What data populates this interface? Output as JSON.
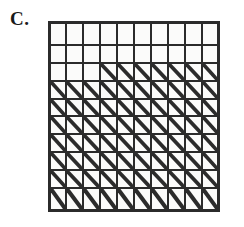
{
  "figure": {
    "label": "C.",
    "type": "grid-diagram",
    "colors": {
      "line": "#2b2b2b",
      "cell_fill": "#fbfbfa",
      "background": "#ffffff",
      "label": "#1a1a1a"
    }
  },
  "grid": {
    "rows": 10,
    "columns": 10,
    "total_cells": 100,
    "hatched_cells": 77,
    "empty_cells": 23,
    "diagonal_direction": "top-left-to-bottom-right",
    "row_labels": [
      "1",
      "2",
      "3",
      "4",
      "5",
      "6",
      "7",
      "8",
      "9",
      "10"
    ],
    "column_labels": [
      "1",
      "2",
      "3",
      "4",
      "5",
      "6",
      "7",
      "8",
      "9",
      "10"
    ],
    "cells": [
      [
        0,
        0,
        0,
        0,
        0,
        0,
        0,
        0,
        0,
        0
      ],
      [
        0,
        0,
        0,
        0,
        0,
        0,
        0,
        0,
        0,
        0
      ],
      [
        0,
        0,
        0,
        1,
        1,
        1,
        1,
        1,
        1,
        1
      ],
      [
        1,
        1,
        1,
        1,
        1,
        1,
        1,
        1,
        1,
        1
      ],
      [
        1,
        1,
        1,
        1,
        1,
        1,
        1,
        1,
        1,
        1
      ],
      [
        1,
        1,
        1,
        1,
        1,
        1,
        1,
        1,
        1,
        1
      ],
      [
        1,
        1,
        1,
        1,
        1,
        1,
        1,
        1,
        1,
        1
      ],
      [
        1,
        1,
        1,
        1,
        1,
        1,
        1,
        1,
        1,
        1
      ],
      [
        1,
        1,
        1,
        1,
        1,
        1,
        1,
        1,
        1,
        1
      ],
      [
        1,
        1,
        1,
        1,
        1,
        1,
        1,
        1,
        1,
        1
      ]
    ]
  }
}
